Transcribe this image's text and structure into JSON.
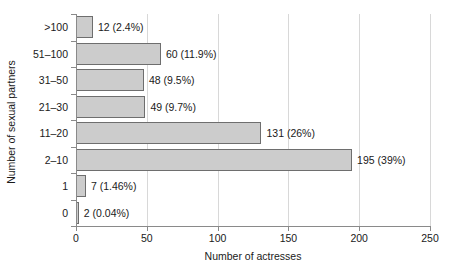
{
  "chart_data": {
    "type": "bar",
    "orientation": "horizontal",
    "title": "",
    "xlabel": "Number of actresses",
    "ylabel": "Number of sexual partners",
    "categories": [
      ">100",
      "51–100",
      "31–50",
      "21–30",
      "11–20",
      "2–10",
      "1",
      "0"
    ],
    "values": [
      12,
      60,
      48,
      49,
      131,
      195,
      7,
      2
    ],
    "data_labels": [
      "12 (2.4%)",
      "60 (11.9%)",
      "48 (9.5%)",
      "49 (9.7%)",
      "131 (26%)",
      "195 (39%)",
      "7 (1.46%)",
      "2 (0.04%)"
    ],
    "percentages": [
      2.4,
      11.9,
      9.5,
      9.7,
      26,
      39,
      1.46,
      0.04
    ],
    "xlim": [
      0,
      250
    ],
    "xticks": [
      0,
      50,
      100,
      150,
      200,
      250
    ],
    "xticklabels": [
      "0",
      "50",
      "100",
      "150",
      "200",
      "250"
    ],
    "grid": "vertical",
    "legend": "none",
    "colors": {
      "bar_fill": "#cccccc",
      "bar_edge": "#6e6e6e",
      "gridline": "#d8d8d8",
      "axis": "#8a8a8a",
      "text": "#1a1a1a",
      "background": "#ffffff"
    }
  }
}
